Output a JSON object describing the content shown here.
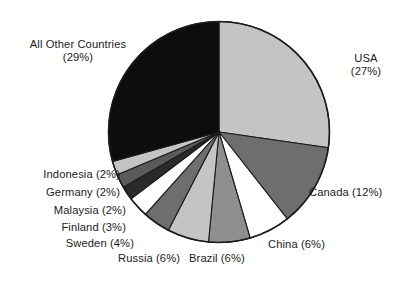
{
  "chart_data": {
    "type": "pie",
    "title": "",
    "subtitle": "",
    "xlabel": "",
    "ylabel": "",
    "grid": false,
    "legend_position": "none",
    "label_format": "name (value%)",
    "start_angle_deg": 0,
    "direction": "clockwise",
    "background_color": "#ffffff",
    "outline_color": "#1b1b1b",
    "text_color": "#1b1b1b",
    "categories": [
      "USA",
      "Canada",
      "China",
      "Brazil",
      "Russia",
      "Sweden",
      "Finland",
      "Malaysia",
      "Germany",
      "Indonesia",
      "All Other Countries"
    ],
    "values": [
      27,
      12,
      6,
      6,
      6,
      4,
      3,
      2,
      2,
      2,
      29
    ],
    "colors": [
      "#c4c4c4",
      "#6e6e6e",
      "#ffffff",
      "#8f8f8f",
      "#c4c4c4",
      "#6e6e6e",
      "#ffffff",
      "#2a2a2a",
      "#5a5a5a",
      "#c4c4c4",
      "#0d0d0d"
    ],
    "slices": [
      {
        "name": "USA",
        "value": 27,
        "color": "#c4c4c4",
        "label": "USA\n(27%)"
      },
      {
        "name": "Canada",
        "value": 12,
        "color": "#6e6e6e",
        "label": "Canada (12%)"
      },
      {
        "name": "China",
        "value": 6,
        "color": "#ffffff",
        "label": "China (6%)"
      },
      {
        "name": "Brazil",
        "value": 6,
        "color": "#8f8f8f",
        "label": "Brazil (6%)"
      },
      {
        "name": "Russia",
        "value": 6,
        "color": "#c4c4c4",
        "label": "Russia (6%)"
      },
      {
        "name": "Sweden",
        "value": 4,
        "color": "#6e6e6e",
        "label": "Sweden (4%)"
      },
      {
        "name": "Finland",
        "value": 3,
        "color": "#ffffff",
        "label": "Finland (3%)"
      },
      {
        "name": "Malaysia",
        "value": 2,
        "color": "#2a2a2a",
        "label": "Malaysia (2%)"
      },
      {
        "name": "Germany",
        "value": 2,
        "color": "#5a5a5a",
        "label": "Germany (2%)"
      },
      {
        "name": "Indonesia",
        "value": 2,
        "color": "#c4c4c4",
        "label": "Indonesia (2%)"
      },
      {
        "name": "All Other Countries",
        "value": 29,
        "color": "#0d0d0d",
        "label": "All Other Countries\n(29%)"
      }
    ]
  },
  "labels": {
    "usa": "USA\n(27%)",
    "canada": "Canada (12%)",
    "china": "China (6%)",
    "brazil": "Brazil (6%)",
    "russia": "Russia (6%)",
    "sweden": "Sweden (4%)",
    "finland": "Finland (3%)",
    "malaysia": "Malaysia (2%)",
    "germany": "Germany (2%)",
    "indonesia": "Indonesia (2%)",
    "all_other_countries": "All Other Countries\n(29%)"
  }
}
